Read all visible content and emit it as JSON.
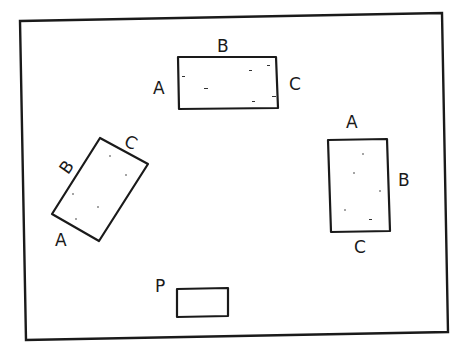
{
  "diagram": {
    "frame": {
      "points": "20,21 442,13 448,332 26,340"
    },
    "rectangles": [
      {
        "id": "top",
        "labels": {
          "A": "A",
          "B": "B",
          "C": "C"
        },
        "label_positions": {
          "A": [
            153,
            94
          ],
          "B": [
            217,
            52
          ],
          "C": [
            289,
            90
          ]
        },
        "points": "178,57 276,57 278,108 179,109"
      },
      {
        "id": "left-tilted",
        "labels": {
          "A": "A",
          "B": "B",
          "C": "C"
        },
        "label_positions": {
          "A": [
            55,
            246
          ],
          "B": [
            60,
            172
          ],
          "C": [
            125,
            148
          ]
        },
        "points": "100,138 148,164 99,241 52,214"
      },
      {
        "id": "right",
        "labels": {
          "A": "A",
          "B": "B",
          "C": "C"
        },
        "label_positions": {
          "A": [
            346,
            128
          ],
          "B": [
            398,
            186
          ],
          "C": [
            354,
            253
          ]
        },
        "points": "328,140 387,139 390,231 331,232"
      }
    ],
    "point_p": {
      "label": "P",
      "label_position": [
        155,
        292
      ],
      "points": "177,289 228,288 228,316 177,317"
    }
  }
}
